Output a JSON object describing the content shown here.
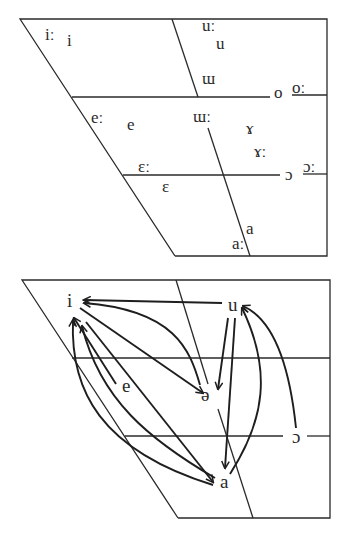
{
  "figure": {
    "top_chart": {
      "title": "Long and short vowel chart",
      "frame": {
        "top_left": [
          20,
          19
        ],
        "top_right": [
          327,
          19
        ],
        "bottom_right": [
          327,
          256
        ],
        "bottom_left": [
          175,
          256
        ]
      },
      "lines": [
        {
          "id": "high-mid-line-left",
          "x1": 72,
          "y1": 97,
          "x2": 270,
          "y2": 97
        },
        {
          "id": "high-mid-line-right",
          "x1": 292,
          "y1": 95,
          "x2": 327,
          "y2": 95
        },
        {
          "id": "low-mid-line-left",
          "x1": 123,
          "y1": 175,
          "x2": 280,
          "y2": 175
        },
        {
          "id": "low-mid-line-right",
          "x1": 303,
          "y1": 174,
          "x2": 327,
          "y2": 174
        },
        {
          "id": "central-line-upper",
          "x1": 172,
          "y1": 19,
          "x2": 198,
          "y2": 97
        },
        {
          "id": "central-line-lower",
          "x1": 208,
          "y1": 128,
          "x2": 250,
          "y2": 256
        }
      ],
      "vowels": [
        {
          "symbol": "iː",
          "x": 45,
          "y": 40,
          "size": 17
        },
        {
          "symbol": "i",
          "x": 67,
          "y": 46,
          "size": 17
        },
        {
          "symbol": "uː",
          "x": 202,
          "y": 31,
          "size": 17
        },
        {
          "symbol": "u",
          "x": 216,
          "y": 49,
          "size": 17
        },
        {
          "symbol": "ɯ",
          "x": 202,
          "y": 84,
          "size": 17
        },
        {
          "symbol": "o",
          "x": 274,
          "y": 98,
          "size": 17
        },
        {
          "symbol": "oː",
          "x": 292,
          "y": 93,
          "size": 17
        },
        {
          "symbol": "eː",
          "x": 91,
          "y": 123,
          "size": 17
        },
        {
          "symbol": "e",
          "x": 127,
          "y": 130,
          "size": 17
        },
        {
          "symbol": "ɯː",
          "x": 193,
          "y": 122,
          "size": 17
        },
        {
          "symbol": "ɤ",
          "x": 246,
          "y": 134,
          "size": 17
        },
        {
          "symbol": "ɤː",
          "x": 254,
          "y": 157,
          "size": 17
        },
        {
          "symbol": "εː",
          "x": 138,
          "y": 172,
          "size": 17
        },
        {
          "symbol": "ɔ",
          "x": 285,
          "y": 180,
          "size": 17
        },
        {
          "symbol": "ɔː",
          "x": 303,
          "y": 172,
          "size": 17
        },
        {
          "symbol": "ε",
          "x": 162,
          "y": 192,
          "size": 17
        },
        {
          "symbol": "a",
          "x": 246,
          "y": 234,
          "size": 17
        },
        {
          "symbol": "aː",
          "x": 232,
          "y": 249,
          "size": 17
        }
      ]
    },
    "bottom_chart": {
      "title": "Vowel shift arrows",
      "frame": {
        "top_left": [
          22,
          280
        ],
        "top_right": [
          330,
          280
        ],
        "bottom_right": [
          330,
          518
        ],
        "bottom_left": [
          178,
          518
        ]
      },
      "lines": [
        {
          "id": "high-mid-line",
          "x1": 72,
          "y1": 358,
          "x2": 330,
          "y2": 358
        },
        {
          "id": "low-mid-line-left",
          "x1": 125,
          "y1": 436,
          "x2": 283,
          "y2": 436
        },
        {
          "id": "low-mid-line-right",
          "x1": 307,
          "y1": 436,
          "x2": 330,
          "y2": 436
        },
        {
          "id": "central-line-upper",
          "x1": 176,
          "y1": 280,
          "x2": 208,
          "y2": 384
        },
        {
          "id": "central-line-lower",
          "x1": 218,
          "y1": 409,
          "x2": 253,
          "y2": 518
        }
      ],
      "vowels": [
        {
          "symbol": "i",
          "x": 67,
          "y": 307,
          "size": 19
        },
        {
          "symbol": "u",
          "x": 228,
          "y": 311,
          "size": 19
        },
        {
          "symbol": "e",
          "x": 122,
          "y": 392,
          "size": 19
        },
        {
          "symbol": "ə",
          "x": 201,
          "y": 401,
          "size": 19
        },
        {
          "symbol": "ɔ",
          "x": 292,
          "y": 443,
          "size": 19
        },
        {
          "symbol": "a",
          "x": 220,
          "y": 488,
          "size": 19
        }
      ],
      "arrows": [
        {
          "id": "u-to-i",
          "from": "u",
          "to": "i",
          "d": "M 222 303 L 84 300"
        },
        {
          "id": "schwa-to-i",
          "from": "ə",
          "to": "i",
          "d": "M 200 385 C 190 350 175 310 84 303"
        },
        {
          "id": "i-to-schwa",
          "from": "i",
          "to": "ə",
          "d": "M 80 308 L 203 393"
        },
        {
          "id": "u-to-schwa",
          "from": "u",
          "to": "ə",
          "d": "M 228 318 L 218 389"
        },
        {
          "id": "u-to-a",
          "from": "u",
          "to": "a",
          "d": "M 235 318 L 225 468"
        },
        {
          "id": "a-to-u",
          "from": "a",
          "to": "u",
          "d": "M 230 474 C 265 420 272 370 242 308"
        },
        {
          "id": "open-o-to-u",
          "from": "ɔ",
          "to": "u",
          "d": "M 296 428 C 290 370 275 320 243 306"
        },
        {
          "id": "e-to-i",
          "from": "e",
          "to": "i",
          "d": "M 116 384 L 74 318"
        },
        {
          "id": "a-to-i",
          "from": "a",
          "to": "i",
          "d": "M 215 478 C 150 440 100 400 82 326"
        },
        {
          "id": "i-to-a",
          "from": "i",
          "to": "a",
          "d": "M 86 322 L 213 482"
        },
        {
          "id": "a-to-i-outer",
          "from": "a",
          "to": "i",
          "d": "M 213 485 C 100 450 70 390 73 320"
        }
      ]
    },
    "colors": {
      "background": "#ffffff",
      "line": "#2a2a2a",
      "arrow": "#1e1e1e",
      "text": "#2a2a2a"
    }
  }
}
